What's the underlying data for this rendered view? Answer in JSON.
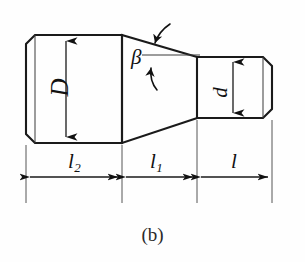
{
  "figure": {
    "caption": "(b)",
    "kind": "engineering-drawing",
    "stroke_color": "#1a1a1a",
    "background_color": "#fefefe"
  },
  "labels": {
    "major_diameter": "D",
    "minor_diameter": "d",
    "taper_angle": "β",
    "length_large_section": "l",
    "length_large_section_sub": "2",
    "length_taper_section": "l",
    "length_taper_section_sub": "1",
    "length_small_section": "l"
  },
  "dimensions": [
    {
      "name": "l2",
      "label": "l",
      "subscript": "2",
      "from_x": 26,
      "to_x": 122
    },
    {
      "name": "l1",
      "label": "l",
      "subscript": "1",
      "from_x": 122,
      "to_x": 197
    },
    {
      "name": "l",
      "label": "l",
      "subscript": "",
      "from_x": 197,
      "to_x": 272
    }
  ],
  "geometry": {
    "large_section": {
      "x1": 26,
      "x2": 122,
      "y_top": 35,
      "y_bottom": 143,
      "chamfer": 9
    },
    "taper_section": {
      "x1": 122,
      "x2": 197,
      "y_top_left": 35,
      "y_top_right": 57,
      "y_bottom_left": 143,
      "y_bottom_right": 118
    },
    "small_section": {
      "x1": 197,
      "x2": 272,
      "y_top": 57,
      "y_bottom": 118,
      "chamfer": 9
    },
    "dimension_line_y": 177,
    "extension_line_bottom_y": 203
  }
}
